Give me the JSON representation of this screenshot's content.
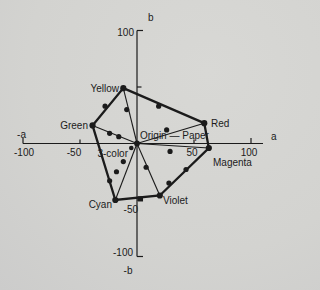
{
  "page": {
    "background": "#d3d3d0",
    "ink_color": "#1b1b1b"
  },
  "chart_data": {
    "type": "line",
    "title": "",
    "description_labels": {
      "origin": "Origin — Paper",
      "three_color": "3-color"
    },
    "axes": {
      "x": {
        "label_positive": "a",
        "label_negative": "-a",
        "min": -100,
        "max": 100,
        "ticks": [
          -100,
          -50,
          50,
          100
        ]
      },
      "y": {
        "label_positive": "b",
        "label_negative": "-b",
        "min": -100,
        "max": 100,
        "ticks": [
          -100,
          -50,
          50,
          100
        ]
      }
    },
    "gamut": {
      "vertices": [
        {
          "name": "Yellow",
          "a": -12,
          "b": 49
        },
        {
          "name": "Red",
          "a": 59,
          "b": 18
        },
        {
          "name": "Magenta",
          "a": 63,
          "b": -4
        },
        {
          "name": "Violet",
          "a": 20,
          "b": -46
        },
        {
          "name": "Cyan",
          "a": -19,
          "b": -50
        },
        {
          "name": "Green",
          "a": -39,
          "b": 16
        }
      ],
      "edge_points": [
        {
          "edge": "Yellow-Red",
          "a": 19,
          "b": 33,
          "marker": "dot"
        },
        {
          "edge": "Magenta-Violet",
          "a": 43,
          "b": -23,
          "marker": "dot"
        },
        {
          "edge": "Magenta-Violet",
          "a": 28,
          "b": -35,
          "marker": "dot"
        },
        {
          "edge": "Violet-Cyan",
          "a": 3,
          "b": -49,
          "marker": "square"
        },
        {
          "edge": "Cyan-Green",
          "a": -24,
          "b": -33,
          "marker": "dot"
        },
        {
          "edge": "Green-Yellow",
          "a": -28,
          "b": 33,
          "marker": "dot"
        }
      ],
      "tint_lines": [
        {
          "to": "Yellow",
          "dots": [
            {
              "a": -9,
              "b": 30
            }
          ]
        },
        {
          "to": "Red",
          "dots": [
            {
              "a": 26,
              "b": 12
            }
          ]
        },
        {
          "to": "Magenta",
          "dots": [
            {
              "a": 29,
              "b": -7
            }
          ]
        },
        {
          "to": "Violet",
          "dots": [
            {
              "a": 8,
              "b": -21
            }
          ]
        },
        {
          "to": "Cyan",
          "dots": [
            {
              "a": -12,
              "b": -16
            },
            {
              "a": -18,
              "b": -25
            }
          ]
        },
        {
          "to": "Green",
          "dots": [
            {
              "a": -24,
              "b": 9
            },
            {
              "a": -16,
              "b": 6
            }
          ]
        }
      ],
      "origin_point": {
        "a": 0,
        "b": 0
      },
      "three_color_point": {
        "a": -5,
        "b": -4
      }
    },
    "labels": [
      {
        "id": "b-axis-label",
        "text": "b",
        "x": 148,
        "y": 21,
        "anchor": "start"
      },
      {
        "id": "y-tick-100",
        "text": "100",
        "x": 134,
        "y": 36,
        "anchor": "end"
      },
      {
        "id": "point-label-yellow",
        "text": "Yellow",
        "x": 119,
        "y": 92,
        "anchor": "end"
      },
      {
        "id": "point-label-red",
        "text": "Red",
        "x": 211,
        "y": 127,
        "anchor": "start"
      },
      {
        "id": "point-label-green",
        "text": "Green",
        "x": 88,
        "y": 129,
        "anchor": "end"
      },
      {
        "id": "neg-a-axis-label",
        "text": "-a",
        "x": 26,
        "y": 138,
        "anchor": "end"
      },
      {
        "id": "a-axis-label",
        "text": "a",
        "x": 271,
        "y": 140,
        "anchor": "start"
      },
      {
        "id": "x-tick-neg100",
        "text": "-100",
        "x": 24,
        "y": 156,
        "anchor": "middle"
      },
      {
        "id": "x-tick-neg50",
        "text": "-50",
        "x": 74,
        "y": 156,
        "anchor": "middle"
      },
      {
        "id": "three-color-label",
        "text": "3-color",
        "x": 128,
        "y": 157,
        "anchor": "end"
      },
      {
        "id": "x-tick-50",
        "text": "50",
        "x": 192,
        "y": 156,
        "anchor": "middle"
      },
      {
        "id": "x-tick-100",
        "text": "100",
        "x": 249,
        "y": 156,
        "anchor": "middle"
      },
      {
        "id": "origin-paper-label",
        "text": "Origin — Paper",
        "x": 140,
        "y": 139,
        "anchor": "start"
      },
      {
        "id": "point-label-magenta",
        "text": "Magenta",
        "x": 213,
        "y": 166,
        "anchor": "start"
      },
      {
        "id": "point-label-violet",
        "text": "Violet",
        "x": 163,
        "y": 204,
        "anchor": "start"
      },
      {
        "id": "point-label-cyan",
        "text": "Cyan",
        "x": 112,
        "y": 208,
        "anchor": "end"
      },
      {
        "id": "y-tick-neg50",
        "text": "-50",
        "x": 138,
        "y": 213,
        "anchor": "end"
      },
      {
        "id": "y-tick-neg100",
        "text": "-100",
        "x": 133,
        "y": 256,
        "anchor": "end"
      },
      {
        "id": "neg-b-axis-label",
        "text": "-b",
        "x": 128,
        "y": 274,
        "anchor": "middle"
      }
    ]
  }
}
